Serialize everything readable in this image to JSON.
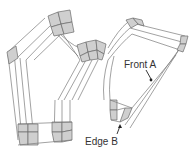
{
  "diagram": {
    "type": "block-structured mesh",
    "labels": {
      "front": "Front A",
      "edge": "Edge B"
    },
    "colors": {
      "block_fill": "#cfcfcf",
      "line": "#7a7a7a",
      "text": "#333333"
    }
  }
}
